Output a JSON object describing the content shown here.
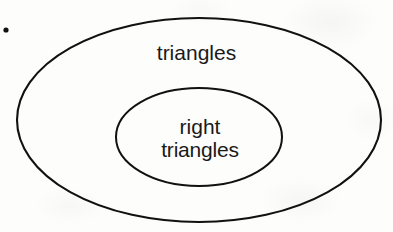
{
  "figure": {
    "type": "venn-diagram-nested",
    "width": 393,
    "height": 232,
    "background_color": "#fdfdfc",
    "stroke_color": "#111111",
    "text_color": "#1a1a1a"
  },
  "marker": {
    "name": "bullet-dot",
    "cx": 6,
    "cy": 30,
    "r": 2.6,
    "color": "#111111"
  },
  "sets": {
    "outer": {
      "label": "triangles",
      "cx": 199,
      "cy": 120,
      "rx": 182,
      "ry": 102,
      "stroke_width": 2.1
    },
    "inner": {
      "label_line1": "right",
      "label_line2": "triangles",
      "cx": 199,
      "cy": 137,
      "rx": 83,
      "ry": 49,
      "stroke_width": 2.0
    }
  },
  "chart_data": {
    "type": "diagram",
    "title": "",
    "relationship": "subset",
    "regions": [
      {
        "name": "triangles",
        "level": 0,
        "contains": "right triangles"
      },
      {
        "name": "right triangles",
        "level": 1,
        "contains": null
      }
    ],
    "annotations": [
      "triangles",
      "right",
      "triangles"
    ]
  }
}
